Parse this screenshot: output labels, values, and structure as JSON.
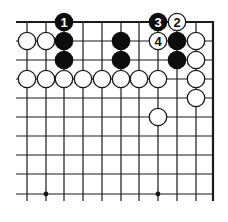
{
  "diagram": {
    "colors": {
      "line": "#1a1a1a",
      "black_stone": "#0d0d0d",
      "white_stone_fill": "#ffffff",
      "white_stone_stroke": "#1a1a1a",
      "black_label": "#ffffff",
      "white_label": "#111111",
      "background": "#ffffff"
    },
    "grid": {
      "columns_x": [
        27,
        46,
        64,
        83,
        102,
        121,
        139,
        158,
        177,
        196
      ],
      "right_edge_x": 213,
      "rows_y": [
        22,
        41,
        60,
        79,
        98,
        117,
        136,
        155,
        174,
        194
      ],
      "left_stub_x": 16,
      "bottom_stub_y": 201,
      "top_edge": true,
      "right_edge": true
    },
    "star_points": [
      {
        "col": 1,
        "row": 9
      },
      {
        "col": 7,
        "row": 9
      }
    ],
    "stones": [
      {
        "color": "black",
        "col": 2,
        "row": 0,
        "label": "1"
      },
      {
        "color": "white",
        "col": 8,
        "row": 0,
        "label": "2"
      },
      {
        "color": "black",
        "col": 7,
        "row": 0,
        "label": "3"
      },
      {
        "color": "white",
        "col": 7,
        "row": 1,
        "label": "4"
      },
      {
        "color": "white",
        "col": 0,
        "row": 1,
        "label": ""
      },
      {
        "color": "white",
        "col": 1,
        "row": 1,
        "label": ""
      },
      {
        "color": "black",
        "col": 2,
        "row": 1,
        "label": ""
      },
      {
        "color": "black",
        "col": 5,
        "row": 1,
        "label": ""
      },
      {
        "color": "black",
        "col": 8,
        "row": 1,
        "label": ""
      },
      {
        "color": "white",
        "col": 9,
        "row": 1,
        "label": ""
      },
      {
        "color": "black",
        "col": 2,
        "row": 2,
        "label": ""
      },
      {
        "color": "black",
        "col": 5,
        "row": 2,
        "label": ""
      },
      {
        "color": "black",
        "col": 8,
        "row": 2,
        "label": ""
      },
      {
        "color": "white",
        "col": 9,
        "row": 2,
        "label": ""
      },
      {
        "color": "white",
        "col": 0,
        "row": 3,
        "label": ""
      },
      {
        "color": "white",
        "col": 1,
        "row": 3,
        "label": ""
      },
      {
        "color": "white",
        "col": 2,
        "row": 3,
        "label": ""
      },
      {
        "color": "white",
        "col": 3,
        "row": 3,
        "label": ""
      },
      {
        "color": "white",
        "col": 4,
        "row": 3,
        "label": ""
      },
      {
        "color": "white",
        "col": 5,
        "row": 3,
        "label": ""
      },
      {
        "color": "white",
        "col": 6,
        "row": 3,
        "label": ""
      },
      {
        "color": "white",
        "col": 7,
        "row": 3,
        "label": ""
      },
      {
        "color": "white",
        "col": 9,
        "row": 3,
        "label": ""
      },
      {
        "color": "white",
        "col": 9,
        "row": 4,
        "label": ""
      },
      {
        "color": "white",
        "col": 7,
        "row": 5,
        "label": ""
      }
    ],
    "stone_radius": 9.3
  }
}
